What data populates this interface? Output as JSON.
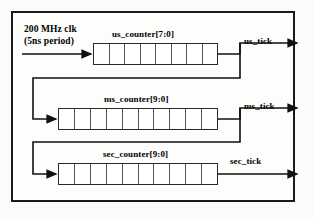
{
  "diagram": {
    "clock": {
      "line1": "200 MHz clk",
      "line2": "(5ns period)"
    },
    "stages": [
      {
        "id": "us",
        "counter_label": "us_counter[7:0]",
        "tick_label": "us_tick",
        "bits": 8,
        "box": {
          "x": 93,
          "y": 43,
          "width": 125,
          "height": 22
        },
        "name_x": 112,
        "name_y": 29,
        "tick_x": 244,
        "tick_y": 36
      },
      {
        "id": "ms",
        "counter_label": "ms_counter[9:0]",
        "tick_label": "ms_tick",
        "bits": 10,
        "box": {
          "x": 58,
          "y": 108,
          "width": 160,
          "height": 22
        },
        "name_x": 104,
        "name_y": 94,
        "tick_x": 244,
        "tick_y": 101
      },
      {
        "id": "sec",
        "counter_label": "sec_counter[9:0]",
        "tick_label": "sec_tick",
        "bits": 10,
        "box": {
          "x": 58,
          "y": 163,
          "width": 160,
          "height": 22
        },
        "name_x": 103,
        "name_y": 149,
        "tick_x": 230,
        "tick_y": 156
      }
    ],
    "colors": {
      "ink": "#111111",
      "box_border": "#2a2a2a",
      "cell_divider": "#555555",
      "frame": "#1a1a1a",
      "page": "#fbfbf9",
      "box_fill": "#ffffff"
    }
  }
}
